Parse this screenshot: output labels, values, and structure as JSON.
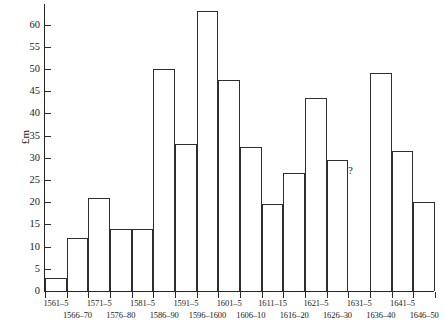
{
  "chart_data": {
    "type": "bar",
    "title": "",
    "xlabel": "",
    "ylabel": "£m",
    "ylim": [
      0,
      64
    ],
    "ytick_step": 5,
    "yticks": [
      0,
      5,
      10,
      15,
      20,
      25,
      30,
      35,
      40,
      45,
      50,
      55,
      60
    ],
    "grid": false,
    "legend": null,
    "annotations": [
      {
        "text": "?",
        "category": "1631–5",
        "note": "no data / value unknown"
      }
    ],
    "categories": [
      "1561–5",
      "1566–70",
      "1571–5",
      "1576–80",
      "1581–5",
      "1586–90",
      "1591–5",
      "1596–1600",
      "1601–5",
      "1606–10",
      "1611–15",
      "1616–20",
      "1621–5",
      "1626–30",
      "1631–5",
      "1636–40",
      "1641–5",
      "1646–50"
    ],
    "values": [
      3,
      12,
      21,
      14,
      14,
      50,
      33,
      63,
      47.5,
      32.5,
      19.5,
      26.5,
      43.5,
      29.5,
      null,
      49,
      31.5,
      20
    ]
  },
  "axes": {
    "y_label": "£m",
    "y_tick_labels": [
      "0",
      "5",
      "10",
      "15",
      "20",
      "25",
      "30",
      "35",
      "40",
      "45",
      "50",
      "55",
      "60"
    ],
    "x_labels_row_a": [
      "1561–5",
      "1571–5",
      "1581–5",
      "1591–5",
      "1601–5",
      "1611–15",
      "1621–5",
      "1631–5",
      "1641–5"
    ],
    "x_labels_row_b": [
      "1566–70",
      "1576–80",
      "1586–90",
      "1596–1600",
      "1606–10",
      "1616–20",
      "1626–30",
      "1636–40",
      "1646–50"
    ]
  },
  "marker": {
    "question": "?"
  },
  "colors": {
    "axis": "#262626",
    "bar_outline": "#2e2e2e",
    "bar_fill": "#ffffff",
    "background": "#ffffff",
    "text": "#1b1b1b"
  }
}
